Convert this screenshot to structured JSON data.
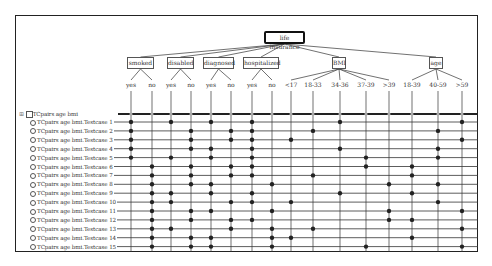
{
  "tree": {
    "root": "life insurance",
    "classifications": [
      {
        "name": "smoked",
        "classes": [
          "yes",
          "no"
        ]
      },
      {
        "name": "disabled",
        "classes": [
          "yes",
          "no"
        ]
      },
      {
        "name": "diagnosed",
        "classes": [
          "yes",
          "no"
        ]
      },
      {
        "name": "hospitalized",
        "classes": [
          "yes",
          "no"
        ]
      },
      {
        "name": "BMI",
        "classes": [
          "<17",
          "18-33",
          "34-36",
          "37-39",
          ">39"
        ]
      },
      {
        "name": "age",
        "classes": [
          "18-39",
          "40-59",
          ">59"
        ]
      }
    ]
  },
  "test_suite": {
    "group_label": "TCpairs age bmi",
    "expand_icon": "plus-expand-icon",
    "cases": [
      {
        "label": "TCpairs age bmi.Testcase 1",
        "marks": [
          0,
          2,
          4,
          6,
          10,
          15
        ]
      },
      {
        "label": "TCpairs age bmi.Testcase 2",
        "marks": [
          0,
          3,
          5,
          6,
          9,
          14
        ]
      },
      {
        "label": "TCpairs age bmi.Testcase 3",
        "marks": [
          0,
          3,
          5,
          6,
          8,
          15
        ]
      },
      {
        "label": "TCpairs age bmi.Testcase 4",
        "marks": [
          0,
          3,
          4,
          6,
          10,
          14
        ]
      },
      {
        "label": "TCpairs age bmi.Testcase 5",
        "marks": [
          0,
          2,
          4,
          6,
          11,
          14
        ]
      },
      {
        "label": "TCpairs age bmi.Testcase 6",
        "marks": [
          1,
          3,
          5,
          6,
          11,
          13
        ]
      },
      {
        "label": "TCpairs age bmi.Testcase 7",
        "marks": [
          1,
          3,
          5,
          6,
          9,
          13
        ]
      },
      {
        "label": "TCpairs age bmi.Testcase 8",
        "marks": [
          1,
          3,
          4,
          7,
          12,
          14
        ]
      },
      {
        "label": "TCpairs age bmi.Testcase 9",
        "marks": [
          1,
          2,
          4,
          6,
          10,
          13
        ]
      },
      {
        "label": "TCpairs age bmi.Testcase 10",
        "marks": [
          1,
          2,
          5,
          6,
          8,
          14
        ]
      },
      {
        "label": "TCpairs age bmi.Testcase 11",
        "marks": [
          1,
          3,
          4,
          7,
          12,
          15
        ]
      },
      {
        "label": "TCpairs age bmi.Testcase 12",
        "marks": [
          1,
          3,
          5,
          6,
          12,
          13
        ]
      },
      {
        "label": "TCpairs age bmi.Testcase 13",
        "marks": [
          1,
          2,
          5,
          7,
          9,
          15
        ]
      },
      {
        "label": "TCpairs age bmi.Testcase 14",
        "marks": [
          1,
          3,
          4,
          7,
          8,
          13
        ]
      },
      {
        "label": "TCpairs age bmi.Testcase 15",
        "marks": [
          1,
          3,
          4,
          7,
          11,
          15
        ]
      }
    ]
  },
  "colors": {
    "line": "#333333",
    "dot": "#222222",
    "header_dot": "#aaaaaa"
  }
}
